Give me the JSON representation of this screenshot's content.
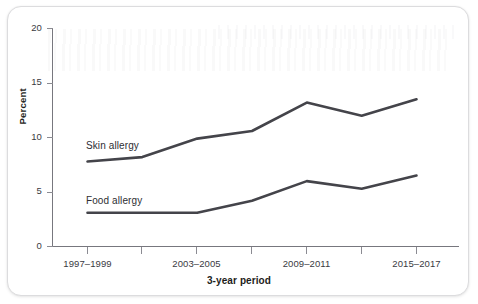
{
  "figure": {
    "y_axis_title": "Percent",
    "x_axis_title": "3-year period"
  },
  "chart_data": {
    "type": "line",
    "title": "",
    "xlabel": "3-year period",
    "ylabel": "Percent",
    "ylim": [
      0,
      20
    ],
    "yticks": [
      0,
      5,
      10,
      15,
      20
    ],
    "grid": false,
    "legend": "inline-series-labels",
    "categories": [
      "1997–1999",
      "2000–2002",
      "2003–2005",
      "2006–2008",
      "2009–2011",
      "2012–2014",
      "2015–2017"
    ],
    "visible_tick_labels": [
      "1997–1999",
      "",
      "2003–2005",
      "",
      "2009–2011",
      "",
      "2015–2017"
    ],
    "series": [
      {
        "name": "Skin allergy",
        "color": "#44444a",
        "values": [
          7.8,
          8.2,
          9.9,
          10.6,
          13.2,
          12.0,
          13.5
        ]
      },
      {
        "name": "Food allergy",
        "color": "#44444a",
        "values": [
          3.1,
          3.1,
          3.1,
          4.2,
          6.0,
          5.3,
          6.5
        ]
      }
    ]
  }
}
